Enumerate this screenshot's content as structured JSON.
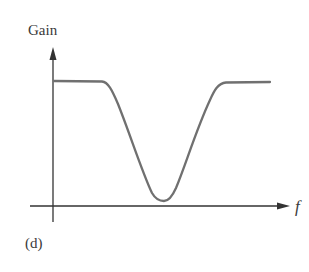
{
  "figure": {
    "y_axis_label": "Gain",
    "x_axis_label": "f",
    "panel_label": "(d)",
    "curve_color": "#707070",
    "axis_color": "#333333"
  }
}
